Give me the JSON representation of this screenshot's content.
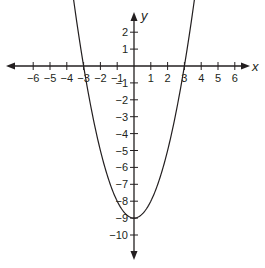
{
  "chart_data": {
    "type": "line",
    "title": "",
    "equation": "y = x^2 - 9",
    "xlabel": "x",
    "ylabel": "y",
    "x_ticks": [
      -6,
      -5,
      -4,
      -3,
      -2,
      -1,
      1,
      2,
      3,
      4,
      5,
      6
    ],
    "y_ticks": [
      2,
      1,
      -1,
      -2,
      -3,
      -4,
      -5,
      -6,
      -7,
      -8,
      -9,
      -10
    ],
    "xlim": [
      -7,
      7
    ],
    "ylim": [
      -11,
      3
    ],
    "grid": false,
    "series": [
      {
        "name": "parabola",
        "x": [
          -3.7,
          -3,
          -2,
          -1,
          0,
          1,
          2,
          3,
          3.7
        ],
        "y": [
          4.69,
          0,
          -5,
          -8,
          -9,
          -8,
          -5,
          0,
          4.69
        ]
      }
    ],
    "vertex": [
      0,
      -9
    ],
    "x_intercepts": [
      -3,
      3
    ],
    "y_intercept": -9
  },
  "axes": {
    "x_label": "x",
    "y_label": "y"
  },
  "style": {
    "ink": "#231f20"
  }
}
